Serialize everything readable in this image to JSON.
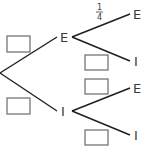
{
  "diagram": {
    "type": "probability-tree",
    "colors": {
      "line": "#1e1e1e",
      "text": "#3a3a3a",
      "box_border": "#6a6a6a",
      "background": "#ffffff"
    },
    "first_stage": {
      "outcomes": [
        {
          "label": "E",
          "probability": ""
        },
        {
          "label": "I",
          "probability": ""
        }
      ]
    },
    "second_stage": {
      "after_E": [
        {
          "label": "E",
          "probability_numerator": "1",
          "probability_denominator": "4"
        },
        {
          "label": "I",
          "probability": ""
        }
      ],
      "after_I": [
        {
          "label": "E",
          "probability": ""
        },
        {
          "label": "I",
          "probability": ""
        }
      ]
    }
  }
}
